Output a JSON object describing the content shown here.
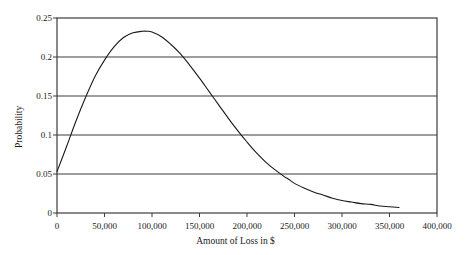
{
  "chart_data": {
    "type": "line",
    "title": "",
    "xlabel": "Amount of Loss in $",
    "ylabel": "Probability",
    "xlim": [
      0,
      400000
    ],
    "ylim": [
      0,
      0.25
    ],
    "grid": true,
    "legend": false,
    "xticks": [
      0,
      50000,
      100000,
      150000,
      200000,
      250000,
      300000,
      350000,
      400000
    ],
    "xtick_labels": [
      "0",
      "50,000",
      "100,000",
      "150,000",
      "200,000",
      "250,000",
      "300,000",
      "350,000",
      "400,000"
    ],
    "yticks": [
      0,
      0.05,
      0.1,
      0.15,
      0.2,
      0.25
    ],
    "ytick_labels": [
      "0",
      "0.05",
      "0.1",
      "0.15",
      "0.2",
      "0.25"
    ],
    "series": [
      {
        "name": "Loss probability density",
        "color": "#1a1a1a",
        "x": [
          0,
          10000,
          20000,
          30000,
          40000,
          50000,
          60000,
          70000,
          80000,
          90000,
          95000,
          100000,
          110000,
          120000,
          130000,
          140000,
          150000,
          160000,
          170000,
          180000,
          190000,
          200000,
          210000,
          220000,
          230000,
          240000,
          243000,
          250000,
          260000,
          270000,
          280000,
          290000,
          300000,
          310000,
          320000,
          330000,
          340000,
          350000,
          360000
        ],
        "y": [
          0.053,
          0.085,
          0.118,
          0.148,
          0.175,
          0.196,
          0.213,
          0.225,
          0.231,
          0.233,
          0.233,
          0.232,
          0.226,
          0.216,
          0.204,
          0.189,
          0.173,
          0.156,
          0.139,
          0.122,
          0.106,
          0.091,
          0.077,
          0.065,
          0.055,
          0.046,
          0.044,
          0.038,
          0.032,
          0.027,
          0.023,
          0.019,
          0.016,
          0.014,
          0.012,
          0.011,
          0.009,
          0.008,
          0.007
        ]
      }
    ],
    "annotations": {
      "peak_value": 0.233,
      "peak_x": 95000,
      "start_value": 0.053,
      "end_value": 0.007,
      "end_x": 360000
    }
  },
  "axis": {
    "y_title": "Probability",
    "x_title": "Amount of Loss in $"
  },
  "style": {
    "line_color": "#1a1a1a",
    "grid_color": "#3c3c3c",
    "axis_color": "#3c3c3c",
    "background": "#ffffff"
  }
}
